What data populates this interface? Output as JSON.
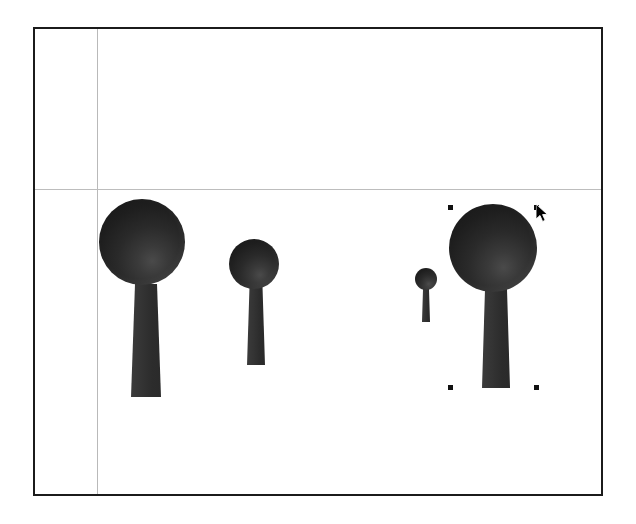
{
  "app": {
    "title": "3D Scene Editor Canvas",
    "background_color": "#ffffff"
  },
  "canvas": {
    "name": "viewport",
    "x": 33,
    "y": 27,
    "width": 570,
    "height": 469,
    "border_color": "#1b1b1b",
    "background_color": "#ffffff"
  },
  "guides": [
    {
      "label": "vertical-guide",
      "orientation": "vertical",
      "position": 62,
      "color": "#b9b9b9"
    },
    {
      "label": "horizontal-guide",
      "orientation": "horizontal",
      "position": 160,
      "color": "#bdbdbd"
    }
  ],
  "objects": [
    {
      "label": "tree-1",
      "selected": false,
      "canopy": {
        "cx": 107,
        "cy": 213,
        "r": 43
      },
      "trunk": {
        "x": 96,
        "y": 255,
        "top_width": 22,
        "bottom_width": 30,
        "height": 113
      },
      "color": "#262626"
    },
    {
      "label": "tree-2",
      "selected": false,
      "canopy": {
        "cx": 219,
        "cy": 235,
        "r": 25
      },
      "trunk": {
        "x": 212,
        "y": 258,
        "top_width": 13,
        "bottom_width": 18,
        "height": 78
      },
      "color": "#262626"
    },
    {
      "label": "tree-3",
      "selected": false,
      "canopy": {
        "cx": 391,
        "cy": 250,
        "r": 11
      },
      "trunk": {
        "x": 387,
        "y": 260,
        "top_width": 6,
        "bottom_width": 8,
        "height": 33
      },
      "color": "#262626"
    },
    {
      "label": "tree-4",
      "selected": true,
      "canopy": {
        "cx": 458,
        "cy": 219,
        "r": 44
      },
      "trunk": {
        "x": 447,
        "y": 260,
        "top_width": 22,
        "bottom_width": 28,
        "height": 99
      },
      "color": "#262626"
    }
  ],
  "selection": {
    "label": "selection-handles",
    "object": "tree-4",
    "handle_color": "#111111",
    "handle_size": 5,
    "handles": [
      {
        "label": "handle-top-left",
        "x": 413,
        "y": 176
      },
      {
        "label": "handle-top-right",
        "x": 499,
        "y": 176
      },
      {
        "label": "handle-bottom-left",
        "x": 413,
        "y": 356
      },
      {
        "label": "handle-bottom-right",
        "x": 499,
        "y": 356
      }
    ]
  },
  "cursor": {
    "label": "mouse-pointer",
    "x": 501,
    "y": 175,
    "type": "arrow",
    "color": "#000000"
  }
}
